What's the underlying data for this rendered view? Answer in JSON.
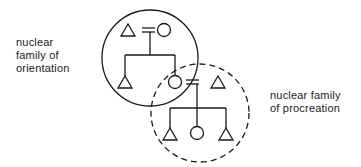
{
  "labels": {
    "orientation": [
      "nuclear",
      "family of",
      "orientation"
    ],
    "procreation": [
      "nuclear family",
      "of procreation"
    ]
  },
  "diagram": {
    "stroke_color": "#1a1a1a",
    "family_of_orientation": {
      "boundary": "solid-circle",
      "parents": [
        "male",
        "female"
      ],
      "children": [
        "male",
        "female"
      ]
    },
    "family_of_procreation": {
      "boundary": "dashed-circle",
      "parents": [
        "female",
        "male"
      ],
      "children": [
        "male",
        "female",
        "male"
      ]
    }
  }
}
